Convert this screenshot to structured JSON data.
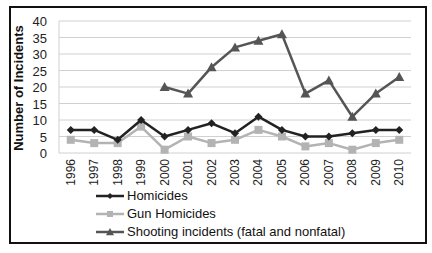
{
  "chart_data": {
    "type": "line",
    "title": "",
    "xlabel": "",
    "ylabel": "Number of Incidents",
    "ylim": [
      0,
      40
    ],
    "yticks": [
      0,
      5,
      10,
      15,
      20,
      25,
      30,
      35,
      40
    ],
    "grid": true,
    "legend_position": "bottom",
    "categories": [
      "1996",
      "1997",
      "1998",
      "1999",
      "2000",
      "2001",
      "2002",
      "2003",
      "2004",
      "2005",
      "2006",
      "2007",
      "2008",
      "2009",
      "2010"
    ],
    "series": [
      {
        "name": "Homicides",
        "marker": "diamond",
        "color": "#222222",
        "values": [
          7,
          7,
          4,
          10,
          5,
          7,
          9,
          6,
          11,
          7,
          5,
          5,
          6,
          7,
          7
        ]
      },
      {
        "name": "Gun Homicides",
        "marker": "square",
        "color": "#b3b3b3",
        "values": [
          4,
          3,
          3,
          8,
          1,
          5,
          3,
          4,
          7,
          5,
          2,
          3,
          1,
          3,
          4
        ]
      },
      {
        "name": "Shooting incidents (fatal and nonfatal)",
        "marker": "triangle",
        "color": "#555555",
        "values": [
          null,
          null,
          null,
          null,
          20,
          18,
          26,
          32,
          34,
          36,
          18,
          22,
          11,
          18,
          23
        ]
      }
    ]
  }
}
